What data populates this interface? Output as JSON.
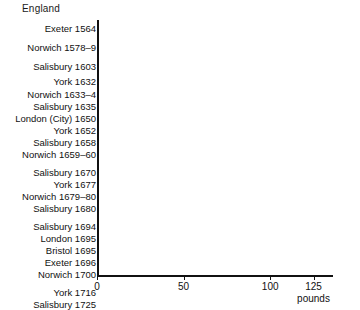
{
  "chart_data": {
    "type": "bar",
    "orientation": "horizontal",
    "title": "England",
    "xlabel": "pounds",
    "ylabel": "",
    "xlim": [
      0,
      136
    ],
    "grid": false,
    "legend": null,
    "xticks": [
      0,
      50,
      100,
      125
    ],
    "xtick_labels": [
      "0",
      "50",
      "100",
      "125"
    ],
    "categories": [
      "Exeter 1564",
      "Norwich 1578–9",
      "Salisbury 1603",
      "York 1632",
      "Norwich 1633–4",
      "Salisbury 1635",
      "London (City) 1650",
      "York 1652",
      "Salisbury 1658",
      "Norwich 1659–60",
      "Salisbury 1670",
      "York 1677",
      "Norwich 1679–80",
      "Salisbury 1680",
      "Salisbury 1694",
      "London 1695",
      "Bristol 1695",
      "Exeter 1696",
      "Norwich 1700",
      "York 1716",
      "Salisbury 1725"
    ],
    "values": [
      35,
      32,
      34,
      27,
      22,
      43,
      88,
      37,
      53,
      61,
      72,
      56,
      89,
      67,
      72,
      84,
      122,
      120,
      89,
      73,
      99
    ],
    "groups": [
      {
        "name": "group-1",
        "categories": [
          "Exeter 1564"
        ]
      },
      {
        "name": "group-2",
        "categories": [
          "Norwich 1578–9"
        ]
      },
      {
        "name": "group-3",
        "categories": [
          "Salisbury 1603"
        ]
      },
      {
        "name": "group-4",
        "categories": [
          "York 1632",
          "Norwich 1633–4",
          "Salisbury 1635",
          "London (City) 1650",
          "York 1652",
          "Salisbury 1658",
          "Norwich 1659–60"
        ]
      },
      {
        "name": "group-5",
        "categories": [
          "Salisbury 1670",
          "York 1677",
          "Norwich 1679–80",
          "Salisbury 1680"
        ]
      },
      {
        "name": "group-6",
        "categories": [
          "Salisbury 1694",
          "London 1695",
          "Bristol 1695",
          "Exeter 1696",
          "Norwich 1700"
        ]
      },
      {
        "name": "group-7",
        "categories": [
          "York 1716",
          "Salisbury 1725"
        ]
      }
    ],
    "bar_color": "#111111",
    "background_color": "#ffffff"
  },
  "layout": {
    "bars": [
      {
        "label": "Exeter 1564",
        "value": 35,
        "top": 23
      },
      {
        "label": "Norwich 1578–9",
        "value": 32,
        "top": 42
      },
      {
        "label": "Salisbury 1603",
        "value": 34,
        "top": 61
      },
      {
        "label": "York 1632",
        "value": 27,
        "top": 76
      },
      {
        "label": "Norwich 1633–4",
        "value": 22,
        "top": 89
      },
      {
        "label": "Salisbury 1635",
        "value": 43,
        "top": 101
      },
      {
        "label": "London (City) 1650",
        "value": 88,
        "top": 113
      },
      {
        "label": "York 1652",
        "value": 37,
        "top": 125
      },
      {
        "label": "Salisbury 1658",
        "value": 53,
        "top": 137
      },
      {
        "label": "Norwich 1659–60",
        "value": 61,
        "top": 149
      },
      {
        "label": "Salisbury 1670",
        "value": 72,
        "top": 167
      },
      {
        "label": "York 1677",
        "value": 56,
        "top": 179
      },
      {
        "label": "Norwich 1679–80",
        "value": 89,
        "top": 191
      },
      {
        "label": "Salisbury 1680",
        "value": 67,
        "top": 203
      },
      {
        "label": "Salisbury 1694",
        "value": 72,
        "top": 221
      },
      {
        "label": "London 1695",
        "value": 84,
        "top": 233
      },
      {
        "label": "Bristol 1695",
        "value": 122,
        "top": 245
      },
      {
        "label": "Exeter 1696",
        "value": 120,
        "top": 257
      },
      {
        "label": "Norwich 1700",
        "value": 89,
        "top": 269
      },
      {
        "label": "York 1716",
        "value": 73,
        "top": 287
      },
      {
        "label": "Salisbury 1725",
        "value": 99,
        "top": 299
      }
    ]
  }
}
